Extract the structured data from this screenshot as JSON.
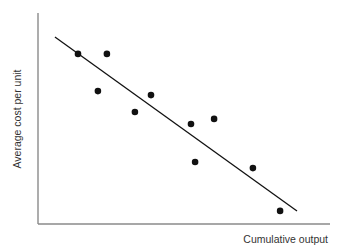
{
  "chart_data": {
    "type": "scatter",
    "title": "",
    "xlabel": "Cumulative output",
    "ylabel": "Average cost per unit",
    "xlim": [
      0,
      10
    ],
    "ylim": [
      0,
      10
    ],
    "grid": false,
    "legend": null,
    "ticks": {
      "x": [],
      "y": []
    },
    "series": [
      {
        "name": "observations",
        "points": [
          {
            "x": 1.37,
            "y": 8.06
          },
          {
            "x": 2.36,
            "y": 8.06
          },
          {
            "x": 2.05,
            "y": 6.3
          },
          {
            "x": 3.32,
            "y": 5.31
          },
          {
            "x": 3.87,
            "y": 6.11
          },
          {
            "x": 5.24,
            "y": 4.74
          },
          {
            "x": 6.03,
            "y": 4.98
          },
          {
            "x": 5.38,
            "y": 2.94
          },
          {
            "x": 7.36,
            "y": 2.65
          },
          {
            "x": 8.29,
            "y": 0.62
          }
        ]
      }
    ],
    "trend_line": {
      "x1": 0.58,
      "y1": 8.86,
      "x2": 8.87,
      "y2": 0.62
    },
    "annotations": []
  },
  "colors": {
    "axis": "#8a8a8a",
    "points": "#111111",
    "line": "#111111",
    "text": "#333333"
  }
}
